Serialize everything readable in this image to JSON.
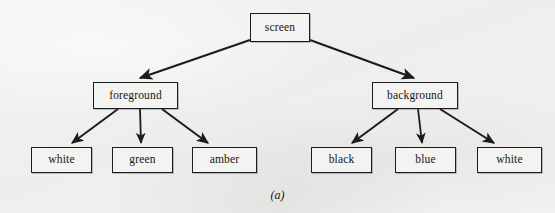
{
  "figure": {
    "caption": "(a)",
    "background_color": "#f1f1f0",
    "line_color": "#1c1c1c",
    "box_fill_color": "#f3f3f2",
    "text_color": "#161616"
  },
  "tree": {
    "root": {
      "label": "screen",
      "x": 250,
      "y": 13,
      "w": 60,
      "h": 29
    },
    "level2": [
      {
        "label": "foreground",
        "x": 93,
        "y": 82,
        "w": 85,
        "h": 27
      },
      {
        "label": "background",
        "x": 372,
        "y": 82,
        "w": 86,
        "h": 27
      }
    ],
    "leaves": [
      {
        "label": "white",
        "x": 31,
        "y": 147,
        "w": 61,
        "h": 26,
        "parent": "foreground"
      },
      {
        "label": "green",
        "x": 112,
        "y": 147,
        "w": 61,
        "h": 26,
        "parent": "foreground"
      },
      {
        "label": "amber",
        "x": 192,
        "y": 147,
        "w": 65,
        "h": 26,
        "parent": "foreground"
      },
      {
        "label": "black",
        "x": 311,
        "y": 147,
        "w": 61,
        "h": 26,
        "parent": "background"
      },
      {
        "label": "blue",
        "x": 395,
        "y": 147,
        "w": 61,
        "h": 26,
        "parent": "background"
      },
      {
        "label": "white",
        "x": 477,
        "y": 147,
        "w": 65,
        "h": 26,
        "parent": "background"
      }
    ],
    "edges": [
      {
        "from": "screen",
        "to": "foreground"
      },
      {
        "from": "screen",
        "to": "background"
      },
      {
        "from": "foreground",
        "to": "white"
      },
      {
        "from": "foreground",
        "to": "green"
      },
      {
        "from": "foreground",
        "to": "amber"
      },
      {
        "from": "background",
        "to": "black"
      },
      {
        "from": "background",
        "to": "blue"
      },
      {
        "from": "background",
        "to": "white"
      }
    ]
  }
}
